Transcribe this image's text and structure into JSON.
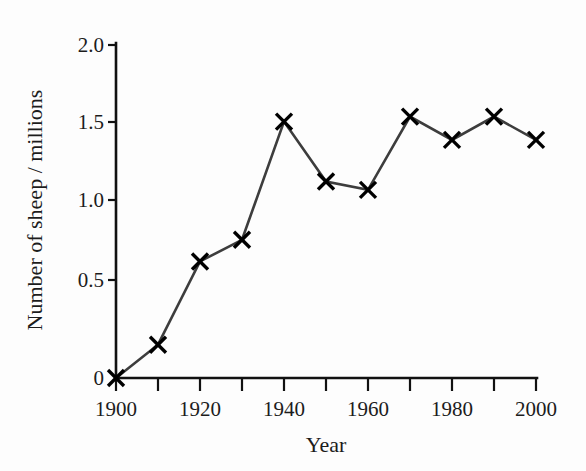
{
  "chart_data": {
    "type": "line",
    "title": "",
    "xlabel": "Year",
    "ylabel": "Number of sheep / millions",
    "x": [
      1900,
      1910,
      1920,
      1930,
      1940,
      1950,
      1960,
      1970,
      1980,
      1990,
      2000
    ],
    "values": [
      0,
      0.2,
      0.7,
      0.83,
      1.54,
      1.18,
      1.13,
      1.57,
      1.43,
      1.57,
      1.43
    ],
    "series": [
      {
        "name": "Number of sheep",
        "values": [
          0,
          0.2,
          0.7,
          0.83,
          1.54,
          1.18,
          1.13,
          1.57,
          1.43,
          1.57,
          1.43
        ]
      }
    ],
    "xlim": [
      1900,
      2000
    ],
    "ylim": [
      0,
      2.0
    ],
    "x_tick_labels": [
      "1900",
      "1920",
      "1940",
      "1960",
      "1980",
      "2000"
    ],
    "x_tick_values": [
      1900,
      1920,
      1940,
      1960,
      1980,
      2000
    ],
    "x_minor_tick_values": [
      1910,
      1930,
      1950,
      1970,
      1990
    ],
    "y_tick_labels": [
      "0",
      "0.5",
      "1.0",
      "1.5",
      "2.0"
    ],
    "y_tick_values": [
      0,
      0.5,
      1.0,
      1.5,
      2.0
    ],
    "grid": false,
    "legend": false,
    "legend_position": "none",
    "marker": "x",
    "line_color": "#3d3d3d",
    "marker_color": "#000000",
    "background_color": "#fdfdfd"
  },
  "axes": {
    "x_title": "Year",
    "y_title": "Number of sheep / millions",
    "y_ticks": [
      "2.0",
      "1.5",
      "1.0",
      "0.5",
      "0"
    ],
    "x_ticks": [
      "1900",
      "1920",
      "1940",
      "1960",
      "1980",
      "2000"
    ]
  }
}
